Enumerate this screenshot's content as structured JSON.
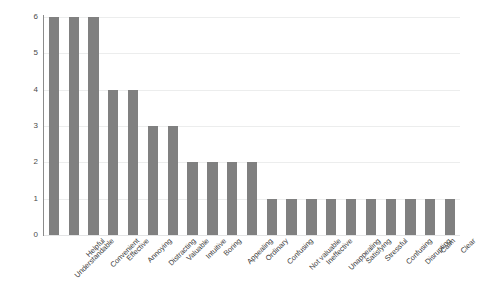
{
  "chart_data": {
    "type": "bar",
    "title": "",
    "subtitle": "",
    "xlabel": "",
    "ylabel": "",
    "ylim": [
      0,
      6
    ],
    "yticks": [
      0,
      1,
      2,
      3,
      4,
      5,
      6
    ],
    "ytick_labels": [
      "0",
      "1",
      "2",
      "3",
      "4",
      "5",
      "6"
    ],
    "grid": true,
    "legend": false,
    "legend_position": "none",
    "bar_color": "#808080",
    "background_color": "#ffffff",
    "gridline_color": "#eceded",
    "axis_color": "#8b8b8b",
    "xtick_rotation": -45,
    "categories": [
      "Understandable",
      "Helpful",
      "Convenient",
      "Effective",
      "Annoying",
      "Distracting",
      "Valuable",
      "Intuitive",
      "Boring",
      "Appealing",
      "Ordinary",
      "Confusing",
      "Not valuable",
      "Ineffective",
      "Unappealing",
      "Satisfying",
      "Stressful",
      "Confusing",
      "Disrupting",
      "Calm",
      "Clear"
    ],
    "values": [
      6,
      6,
      6,
      4,
      4,
      3,
      3,
      2,
      2,
      2,
      2,
      1,
      1,
      1,
      1,
      1,
      1,
      1,
      1,
      1,
      1
    ]
  }
}
